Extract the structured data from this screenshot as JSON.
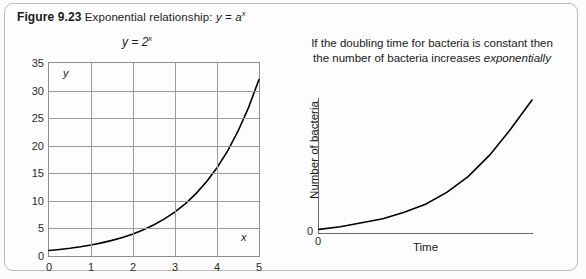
{
  "figure": {
    "label": "Figure 9.23",
    "caption": "Exponential relationship:",
    "caption_formula_base": "y = a",
    "caption_formula_exp": "x"
  },
  "left_chart": {
    "title_base": "y = 2",
    "title_exp": "x",
    "y_axis_letter": "y",
    "x_axis_letter": "x"
  },
  "right_chart": {
    "caption_line1": "If the doubling time for bacteria is constant then",
    "caption_line2_plain": "the number of bacteria increases ",
    "caption_line2_italic": "exponentially",
    "ylabel": "Number of bacteria",
    "xlabel": "Time",
    "origin_y_label": "0",
    "origin_x_label": "0"
  },
  "chart_data": [
    {
      "type": "line",
      "id": "left-exponential",
      "title": "y = 2^x",
      "xlabel": "x",
      "ylabel": "y",
      "xlim": [
        0,
        5
      ],
      "ylim": [
        0,
        35
      ],
      "xticks": [
        0,
        1,
        2,
        3,
        4,
        5
      ],
      "yticks": [
        0,
        5,
        10,
        15,
        20,
        25,
        30,
        35
      ],
      "xticklabels": [
        "0",
        "1",
        "2",
        "3",
        "4",
        "5"
      ],
      "yticklabels": [
        "0",
        "5",
        "10",
        "15",
        "20",
        "25",
        "30",
        "35"
      ],
      "grid": true,
      "legend": false,
      "series": [
        {
          "name": "y = 2^x",
          "x": [
            0,
            0.25,
            0.5,
            0.75,
            1,
            1.25,
            1.5,
            1.75,
            2,
            2.25,
            2.5,
            2.75,
            3,
            3.25,
            3.5,
            3.75,
            4,
            4.25,
            4.5,
            4.75,
            5
          ],
          "y": [
            1,
            1.19,
            1.41,
            1.68,
            2,
            2.38,
            2.83,
            3.36,
            4,
            4.76,
            5.66,
            6.73,
            8,
            9.51,
            11.31,
            13.45,
            16,
            19.03,
            22.63,
            26.91,
            32
          ],
          "color": "#000000"
        }
      ]
    },
    {
      "type": "line",
      "id": "right-bacteria",
      "title": "",
      "xlabel": "Time",
      "ylabel": "Number of bacteria",
      "xlim": [
        0,
        1
      ],
      "ylim": [
        0,
        1
      ],
      "xticks": [
        0
      ],
      "yticks": [
        0
      ],
      "xticklabels": [
        "0"
      ],
      "yticklabels": [
        "0"
      ],
      "grid": false,
      "legend": false,
      "series": [
        {
          "name": "bacteria growth",
          "x": [
            0,
            0.1,
            0.2,
            0.3,
            0.4,
            0.5,
            0.6,
            0.7,
            0.8,
            0.9,
            1.0
          ],
          "y": [
            0.02,
            0.04,
            0.07,
            0.1,
            0.15,
            0.21,
            0.3,
            0.42,
            0.58,
            0.78,
            1.0
          ],
          "color": "#000000"
        }
      ]
    }
  ]
}
